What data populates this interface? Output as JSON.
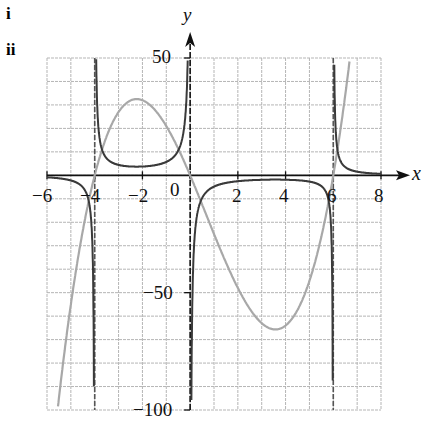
{
  "parts": [
    "i",
    "ii"
  ],
  "chart_data": {
    "type": "line",
    "title": "",
    "xlabel": "x",
    "ylabel": "y",
    "xlim": [
      -6,
      8
    ],
    "ylim": [
      -100,
      50
    ],
    "grid": true,
    "grid_step_x": 1,
    "grid_step_y": 10,
    "x_ticks": [
      -6,
      -4,
      -2,
      0,
      2,
      4,
      6,
      8
    ],
    "x_tick_labels": [
      "−6",
      "−4",
      "−2",
      "0",
      "2",
      "4",
      "6",
      "8"
    ],
    "y_ticks": [
      50,
      -50,
      -100
    ],
    "y_tick_labels": [
      "50",
      "−50",
      "−100"
    ],
    "asymptotes_x": [
      -4,
      0,
      6
    ],
    "series": [
      {
        "name": "i: y = x(x+4)(x−6)",
        "color": "#a8a8a8",
        "function": "x*(x+4)*(x-6)",
        "x": [
          -5.6,
          -5,
          -4,
          -3,
          -2,
          -1,
          0,
          1,
          2,
          3,
          3.5,
          4,
          5,
          6,
          6.7
        ],
        "y": [
          -100,
          -55,
          0,
          27,
          32,
          21,
          0,
          -25,
          -48,
          -63,
          -66,
          -64,
          -45,
          0,
          50
        ]
      },
      {
        "name": "ii: y = 1 / (x(x+4)(x−6))",
        "color": "#3a3a3a",
        "function": "1/(x*(x+4)*(x-6))",
        "scale_note": "reciprocal graph with vertical asymptotes at x = −4, 0, 6"
      }
    ]
  },
  "axis": {
    "x_label": "x",
    "y_label": "y",
    "origin_label": "0"
  }
}
